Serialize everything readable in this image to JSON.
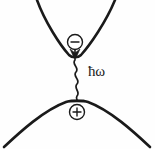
{
  "figure": {
    "background_color": "#fefefe",
    "stroke_color": "#1a1a1a",
    "width": 155,
    "height": 149
  },
  "labels": {
    "photon_energy": "ħω"
  },
  "carriers": {
    "electron": {
      "name": "electron",
      "sign": "−",
      "cx": 75,
      "cy": 42,
      "r": 7.5
    },
    "hole": {
      "name": "hole",
      "sign": "+",
      "cx": 77,
      "cy": 112,
      "r": 7.5
    }
  },
  "bands": {
    "conduction": {
      "name": "conduction-band",
      "shape": "parabola-up",
      "minimum_x": 75,
      "minimum_y": 57,
      "stroke_width": 2.6
    },
    "valence": {
      "name": "valence-band",
      "shape": "parabola-down",
      "maximum_x": 77,
      "maximum_y": 100,
      "stroke_width": 2.6
    }
  },
  "photon": {
    "name": "emitted-photon",
    "start_y": 59,
    "end_y": 99,
    "wave_x": 76,
    "amplitude": 4,
    "cycles": 4
  }
}
